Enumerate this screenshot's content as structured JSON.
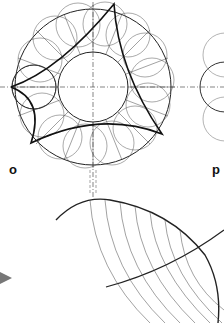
{
  "figure": {
    "panels": [
      {
        "id": "o",
        "label": "o"
      },
      {
        "id": "p",
        "label": "p"
      }
    ]
  }
}
